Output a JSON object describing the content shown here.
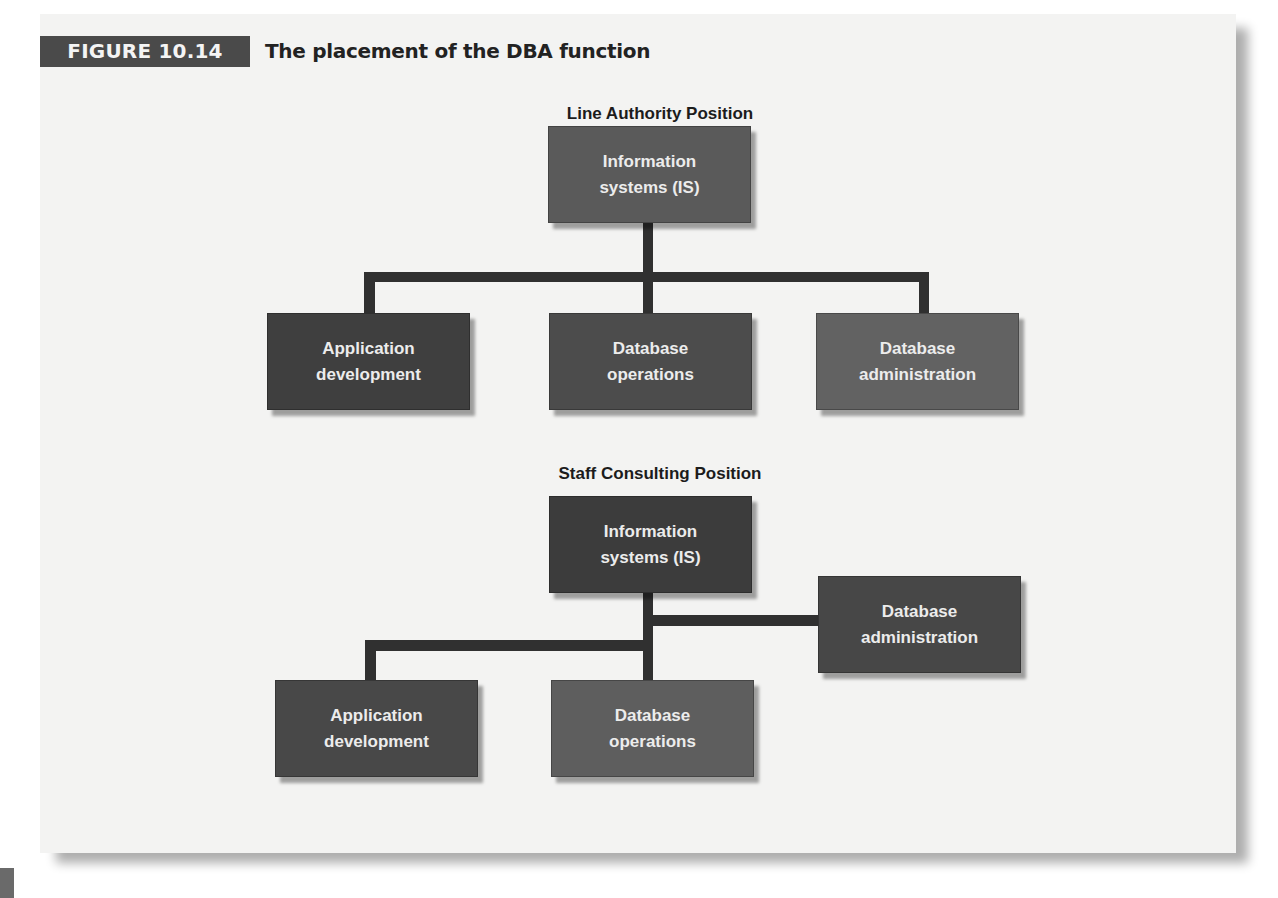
{
  "figure": {
    "label": "FIGURE 10.14",
    "title": "The placement of the DBA function"
  },
  "colors": {
    "label_bg": "#4a4a4a",
    "box_dark": "#3f3f3f",
    "box_medium": "#5a5a5a",
    "box_light": "#626262",
    "connector": "#303030",
    "page_bg": "#f3f3f2"
  },
  "line_authority": {
    "heading": "Line Authority Position",
    "top": {
      "line1": "Information",
      "line2": "systems (IS)"
    },
    "children": [
      {
        "line1": "Application",
        "line2": "development"
      },
      {
        "line1": "Database",
        "line2": "operations"
      },
      {
        "line1": "Database",
        "line2": "administration"
      }
    ]
  },
  "staff_consulting": {
    "heading": "Staff Consulting Position",
    "top": {
      "line1": "Information",
      "line2": "systems (IS)"
    },
    "staff": {
      "line1": "Database",
      "line2": "administration"
    },
    "children": [
      {
        "line1": "Application",
        "line2": "development"
      },
      {
        "line1": "Database",
        "line2": "operations"
      }
    ]
  }
}
